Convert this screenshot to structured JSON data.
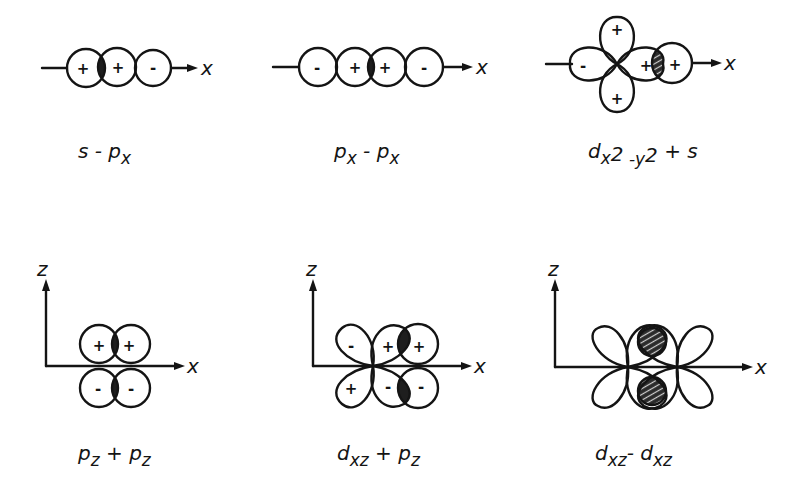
{
  "figure": {
    "colors": {
      "ink": "#141414",
      "background": "#ffffff",
      "overlap_fill": "#1e1e1e"
    },
    "axis_labels": {
      "x": "x",
      "z": "z"
    },
    "panels": [
      {
        "id": "s-px",
        "label": {
          "main": "s - p",
          "sub": "x"
        },
        "orbitals": [
          {
            "type": "s",
            "signs": [
              "+"
            ]
          },
          {
            "type": "p_x",
            "signs": [
              "+",
              "-"
            ]
          }
        ],
        "overlap": "positive (shaded)"
      },
      {
        "id": "px-px",
        "label": {
          "a": "p",
          "a_sub": "x",
          "op": " - ",
          "b": "p",
          "b_sub": "x"
        },
        "orbitals": [
          {
            "type": "p_x",
            "signs": [
              "-",
              "+"
            ]
          },
          {
            "type": "p_x",
            "signs": [
              "+",
              "-"
            ]
          }
        ],
        "overlap": "positive (shaded)"
      },
      {
        "id": "dx2y2-s",
        "label": {
          "a": "d",
          "a_sub": "x",
          "sup1": "2",
          "minus": " -",
          "y": "y",
          "sup2": "2",
          "op": " + s"
        },
        "orbitals": [
          {
            "type": "d_x2-y2",
            "signs": [
              "+",
              "-",
              "+",
              "+"
            ]
          },
          {
            "type": "s",
            "signs": [
              "+"
            ]
          }
        ],
        "overlap": "positive (hatched)"
      },
      {
        "id": "pz-pz",
        "label": {
          "a": "p",
          "a_sub": "z",
          "op": " + ",
          "b": "p",
          "b_sub": "z"
        },
        "orbitals": [
          {
            "type": "p_z",
            "signs": [
              "+",
              "-"
            ]
          },
          {
            "type": "p_z",
            "signs": [
              "+",
              "-"
            ]
          }
        ],
        "overlap": "two regions (shaded)"
      },
      {
        "id": "dxz-pz",
        "label": {
          "a": "d",
          "a_sub": "xz",
          "op": " + ",
          "b": "p",
          "b_sub": "z"
        },
        "orbitals": [
          {
            "type": "d_xz",
            "signs": [
              "-",
              "+",
              "+",
              "-"
            ]
          },
          {
            "type": "p_z",
            "signs": [
              "+",
              "-"
            ]
          }
        ],
        "overlap": "two regions (shaded)"
      },
      {
        "id": "dxz-dxz",
        "label": {
          "a": "d",
          "a_sub": "xz",
          "op": "- ",
          "b": "d",
          "b_sub": "xz"
        },
        "orbitals": [
          {
            "type": "d_xz",
            "signs": []
          },
          {
            "type": "d_xz",
            "signs": []
          }
        ],
        "overlap": "two regions (hatched)"
      }
    ],
    "signs": {
      "p1": [
        "+",
        "+",
        "-"
      ],
      "p2": [
        "-",
        "+",
        "+",
        "-"
      ],
      "p3": [
        "-",
        "+",
        "+",
        "+"
      ],
      "p4": [
        "+",
        "+",
        "-",
        "-"
      ],
      "p5": [
        "-",
        "+",
        "+",
        "+",
        "-",
        "-"
      ]
    }
  }
}
